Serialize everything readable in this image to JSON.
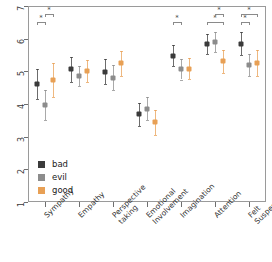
{
  "chart_data": {
    "type": "scatter",
    "title": "",
    "xlabel": "",
    "ylabel": "",
    "ylim": [
      1,
      7
    ],
    "yticks": [
      1,
      2,
      3,
      4,
      5,
      6,
      7
    ],
    "ytick_labels": [
      "1",
      "2",
      "3",
      "4",
      "5",
      "6",
      "7"
    ],
    "grid": false,
    "legend_position": "bottom-left",
    "error_bars": "95% CI",
    "categories": [
      "Sympathy",
      "Empathy",
      "Perspective\ntaking",
      "Emotional\nInvolvement",
      "Imagination",
      "Attention",
      "Felt\nSuspense"
    ],
    "series": [
      {
        "name": "bad",
        "color": "#3b3b3b",
        "values": [
          4.61,
          5.06,
          4.99,
          3.68,
          5.48,
          5.84,
          5.85
        ],
        "ci_low": [
          4.15,
          4.68,
          4.62,
          3.32,
          5.16,
          5.53,
          5.5
        ],
        "ci_high": [
          5.06,
          5.44,
          5.37,
          4.04,
          5.81,
          6.14,
          6.2
        ]
      },
      {
        "name": "evil",
        "color": "#8c8c8c",
        "values": [
          3.98,
          4.86,
          4.81,
          3.86,
          5.06,
          5.9,
          5.19
        ],
        "ci_low": [
          3.52,
          4.55,
          4.42,
          3.5,
          4.75,
          5.6,
          4.85
        ],
        "ci_high": [
          4.44,
          5.17,
          5.2,
          4.22,
          5.37,
          6.2,
          5.53
        ]
      },
      {
        "name": "good",
        "color": "#e8a055",
        "values": [
          4.72,
          5.0,
          5.24,
          3.44,
          5.08,
          5.31,
          5.26
        ],
        "ci_low": [
          4.2,
          4.66,
          4.86,
          3.06,
          4.76,
          4.96,
          4.86
        ],
        "ci_high": [
          5.25,
          5.34,
          5.62,
          3.82,
          5.4,
          5.66,
          5.66
        ]
      }
    ],
    "significance_markers": [
      {
        "category": "Sympathy",
        "label": "*",
        "from_series": "bad",
        "to_series": "evil",
        "level": 0
      },
      {
        "category": "Sympathy",
        "label": "*",
        "from_series": "evil",
        "to_series": "good",
        "level": 1
      },
      {
        "category": "Imagination",
        "label": "*",
        "from_series": "bad",
        "to_series": "evil",
        "level": 0
      },
      {
        "category": "Attention",
        "label": "*",
        "from_series": "bad",
        "to_series": "good",
        "level": 0
      },
      {
        "category": "Attention",
        "label": "*",
        "from_series": "evil",
        "to_series": "good",
        "level": 1
      },
      {
        "category": "Felt Suspense",
        "label": "*",
        "from_series": "bad",
        "to_series": "evil",
        "level": 0
      },
      {
        "category": "Felt Suspense",
        "label": "*",
        "from_series": "bad",
        "to_series": "good",
        "level": 1
      }
    ]
  },
  "legend": {
    "items": [
      {
        "label": "bad",
        "color": "#3b3b3b"
      },
      {
        "label": "evil",
        "color": "#8c8c8c"
      },
      {
        "label": "good",
        "color": "#e8a055"
      }
    ]
  },
  "colors": {
    "bad": "#3b3b3b",
    "evil": "#8c8c8c",
    "good": "#e8a055",
    "axis": "#6f6f6f",
    "frame": "#9a9a9a",
    "background": "#ffffff"
  }
}
